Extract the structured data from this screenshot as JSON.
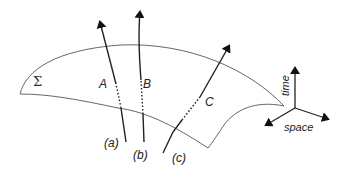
{
  "diagram": {
    "surface_label": "Σ",
    "worldlines": [
      {
        "id": "a",
        "event_label": "A",
        "line_label": "(a)"
      },
      {
        "id": "b",
        "event_label": "B",
        "line_label": "(b)"
      },
      {
        "id": "c",
        "event_label": "C",
        "line_label": "(c)"
      }
    ],
    "axes": {
      "vertical_label": "time",
      "horizontal_label": "space"
    },
    "colors": {
      "stroke": "#222222",
      "surface_stroke": "#555555",
      "background": "#ffffff"
    }
  }
}
